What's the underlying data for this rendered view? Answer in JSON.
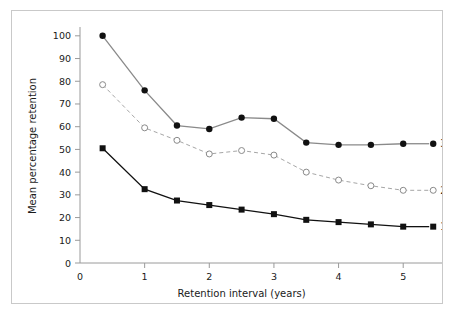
{
  "figure": {
    "frame_color": "#c9c9c9",
    "background": "#ffffff"
  },
  "chart_data": {
    "type": "line",
    "title": "",
    "xlabel": "Retention interval (years)",
    "ylabel": "Mean percentage retention",
    "x": [
      0.35,
      1,
      1.5,
      2,
      2.5,
      3,
      3.5,
      4,
      4.5,
      5
    ],
    "xlim": [
      0,
      5.6
    ],
    "ylim": [
      0,
      103
    ],
    "xticks": [
      0,
      1,
      2,
      3,
      4,
      5
    ],
    "xtick_labels": [
      "0",
      "1",
      "2",
      "3",
      "4",
      "5"
    ],
    "yticks": [
      0,
      10,
      20,
      30,
      40,
      50,
      60,
      70,
      80,
      90,
      100
    ],
    "ytick_labels": [
      "0",
      "10",
      "20",
      "30",
      "40",
      "50",
      "60",
      "70",
      "80",
      "90",
      "100"
    ],
    "grid": false,
    "legend_position": "right-inline-end-of-line",
    "series": [
      {
        "name": "3 cues",
        "label": "3 cues",
        "marker": "filled-circle",
        "linestyle": "solid",
        "line_color": "#8a8a8a",
        "marker_color": "#111111",
        "values": [
          100,
          76,
          60.5,
          59,
          64,
          63.5,
          53,
          52,
          52,
          52.5
        ]
      },
      {
        "name": "2 cues",
        "label": "2 cues",
        "marker": "open-circle",
        "linestyle": "dashed",
        "line_color": "#a6a6a6",
        "marker_color": "#8a8a8a",
        "values": [
          78.5,
          59.5,
          54,
          48,
          49.5,
          47.5,
          40,
          36.5,
          34,
          32
        ]
      },
      {
        "name": "1 cue",
        "label": "1 cue",
        "marker": "filled-square",
        "linestyle": "solid",
        "line_color": "#111111",
        "marker_color": "#111111",
        "values": [
          50.5,
          32.5,
          27.5,
          25.5,
          23.5,
          21.5,
          19,
          18,
          17,
          16
        ]
      }
    ]
  }
}
